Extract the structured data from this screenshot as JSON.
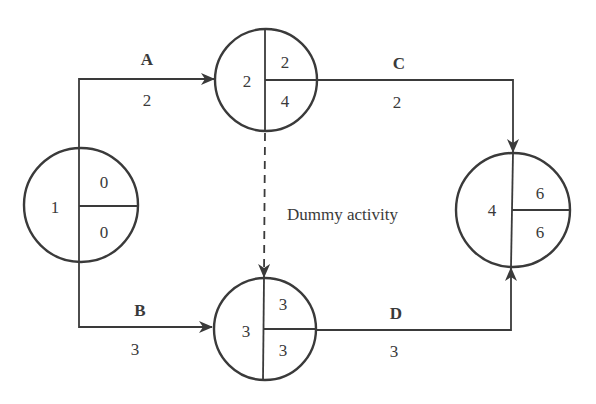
{
  "diagram": {
    "type": "activity-on-arrow network",
    "nodes": [
      {
        "id": "1",
        "label": "1",
        "earliest": "0",
        "latest": "0"
      },
      {
        "id": "2",
        "label": "2",
        "earliest": "2",
        "latest": "4"
      },
      {
        "id": "3",
        "label": "3",
        "earliest": "3",
        "latest": "3"
      },
      {
        "id": "4",
        "label": "4",
        "earliest": "6",
        "latest": "6"
      }
    ],
    "activities": [
      {
        "name": "A",
        "duration": "2",
        "from": "1",
        "to": "2"
      },
      {
        "name": "B",
        "duration": "3",
        "from": "1",
        "to": "3"
      },
      {
        "name": "C",
        "duration": "2",
        "from": "2",
        "to": "4"
      },
      {
        "name": "D",
        "duration": "3",
        "from": "3",
        "to": "4"
      }
    ],
    "dummy": {
      "label": "Dummy activity",
      "from": "2",
      "to": "3",
      "style": "dashed"
    },
    "colors": {
      "stroke": "#3a3a3a",
      "background": "#ffffff"
    }
  }
}
